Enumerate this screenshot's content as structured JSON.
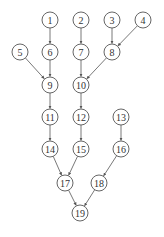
{
  "diagram": {
    "type": "directed-tree",
    "node_radius": 8,
    "colors": {
      "stroke": "#555555",
      "text": "#333333",
      "background": "#ffffff"
    },
    "nodes": [
      {
        "id": "1",
        "label": "1",
        "x": 50,
        "y": 20
      },
      {
        "id": "2",
        "label": "2",
        "x": 81,
        "y": 20
      },
      {
        "id": "3",
        "label": "3",
        "x": 112,
        "y": 20
      },
      {
        "id": "4",
        "label": "4",
        "x": 143,
        "y": 20
      },
      {
        "id": "5",
        "label": "5",
        "x": 20,
        "y": 52
      },
      {
        "id": "6",
        "label": "6",
        "x": 50,
        "y": 52
      },
      {
        "id": "7",
        "label": "7",
        "x": 81,
        "y": 52
      },
      {
        "id": "8",
        "label": "8",
        "x": 112,
        "y": 52
      },
      {
        "id": "9",
        "label": "9",
        "x": 50,
        "y": 85
      },
      {
        "id": "10",
        "label": "10",
        "x": 81,
        "y": 85
      },
      {
        "id": "11",
        "label": "11",
        "x": 50,
        "y": 117
      },
      {
        "id": "12",
        "label": "12",
        "x": 81,
        "y": 117
      },
      {
        "id": "13",
        "label": "13",
        "x": 121,
        "y": 117
      },
      {
        "id": "14",
        "label": "14",
        "x": 50,
        "y": 149
      },
      {
        "id": "15",
        "label": "15",
        "x": 81,
        "y": 149
      },
      {
        "id": "16",
        "label": "16",
        "x": 121,
        "y": 149
      },
      {
        "id": "17",
        "label": "17",
        "x": 65,
        "y": 183
      },
      {
        "id": "18",
        "label": "18",
        "x": 99,
        "y": 183
      },
      {
        "id": "19",
        "label": "19",
        "x": 80,
        "y": 213
      }
    ],
    "edges": [
      {
        "from": "1",
        "to": "6"
      },
      {
        "from": "2",
        "to": "7"
      },
      {
        "from": "3",
        "to": "8"
      },
      {
        "from": "4",
        "to": "8"
      },
      {
        "from": "5",
        "to": "9"
      },
      {
        "from": "6",
        "to": "9"
      },
      {
        "from": "7",
        "to": "10"
      },
      {
        "from": "8",
        "to": "10"
      },
      {
        "from": "9",
        "to": "11"
      },
      {
        "from": "10",
        "to": "12"
      },
      {
        "from": "11",
        "to": "14"
      },
      {
        "from": "12",
        "to": "15"
      },
      {
        "from": "13",
        "to": "16"
      },
      {
        "from": "14",
        "to": "17"
      },
      {
        "from": "15",
        "to": "17"
      },
      {
        "from": "16",
        "to": "18"
      },
      {
        "from": "17",
        "to": "19"
      },
      {
        "from": "18",
        "to": "19"
      }
    ]
  }
}
